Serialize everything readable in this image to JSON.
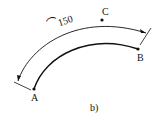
{
  "diagram": {
    "points": {
      "A": "A",
      "B": "B",
      "C": "C"
    },
    "dimension": {
      "symbol": "⌒",
      "value": "150"
    },
    "caption": "b)",
    "colors": {
      "stroke": "#111111",
      "background": "#ffffff"
    }
  }
}
